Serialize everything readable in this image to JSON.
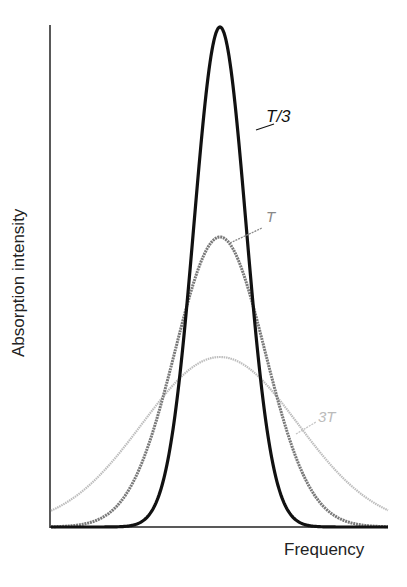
{
  "chart_data": {
    "type": "line",
    "title": "",
    "xlabel": "Frequency",
    "ylabel": "Absorption intensity",
    "grid": false,
    "legend_position": "inline labels",
    "x_ticks": [],
    "y_ticks": [],
    "x": [
      -3.0,
      -2.5,
      -2.0,
      -1.5,
      -1.0,
      -0.5,
      0.0,
      0.5,
      1.0,
      1.5,
      2.0,
      2.5,
      3.0
    ],
    "series": [
      {
        "name": "T/3",
        "color": "#111111",
        "peak_relative": 1.0,
        "width_relative": 1.0,
        "values": [
          0.0,
          0.0,
          0.0,
          0.01,
          0.14,
          0.61,
          1.0,
          0.61,
          0.14,
          0.01,
          0.0,
          0.0,
          0.0
        ]
      },
      {
        "name": "T",
        "color": "#7a7a7a",
        "peak_relative": 0.58,
        "width_relative": 1.73,
        "values": [
          0.01,
          0.03,
          0.07,
          0.14,
          0.25,
          0.37,
          0.58,
          0.37,
          0.25,
          0.14,
          0.07,
          0.03,
          0.01
        ]
      },
      {
        "name": "3T",
        "color": "#bdbdbd",
        "peak_relative": 0.34,
        "width_relative": 3.0,
        "values": [
          0.03,
          0.06,
          0.09,
          0.14,
          0.2,
          0.28,
          0.34,
          0.28,
          0.2,
          0.14,
          0.09,
          0.06,
          0.03
        ]
      }
    ],
    "annotations": [
      "T/3",
      "T",
      "3T"
    ]
  },
  "labels": {
    "y_axis": "Absorption intensity",
    "x_axis": "Frequency",
    "curve_t3": "T/3",
    "curve_t": "T",
    "curve_3t": "3T"
  },
  "colors": {
    "axis": "#222222",
    "t3": "#111111",
    "t": "#7a7a7a",
    "t3x": "#bdbdbd"
  }
}
